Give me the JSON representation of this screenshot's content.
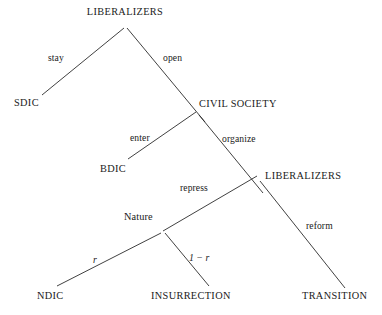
{
  "figure": {
    "type": "game-tree",
    "background_color": "#ffffff",
    "line_color": "#2b2b2b",
    "text_color": "#1a1a1a"
  },
  "nodes": [
    {
      "id": "root",
      "label": "LIBERALIZERS",
      "kind": "player",
      "x": 125,
      "y": 15,
      "anchor": "middle"
    },
    {
      "id": "sdic",
      "label": "SDIC",
      "kind": "outcome",
      "x": 14,
      "y": 106,
      "anchor": "start"
    },
    {
      "id": "civil_society",
      "label": "CIVIL SOCIETY",
      "kind": "player",
      "x": 199,
      "y": 107,
      "anchor": "start"
    },
    {
      "id": "bdic",
      "label": "BDIC",
      "kind": "outcome",
      "x": 100,
      "y": 172,
      "anchor": "start"
    },
    {
      "id": "liberalizers2",
      "label": "LIBERALIZERS",
      "kind": "player",
      "x": 265,
      "y": 179,
      "anchor": "start"
    },
    {
      "id": "nature",
      "label": "Nature",
      "kind": "nature",
      "x": 124,
      "y": 220,
      "anchor": "start"
    },
    {
      "id": "ndic",
      "label": "NDIC",
      "kind": "outcome",
      "x": 37,
      "y": 299,
      "anchor": "start"
    },
    {
      "id": "insurrection",
      "label": "INSURRECTION",
      "kind": "outcome",
      "x": 151,
      "y": 299,
      "anchor": "start"
    },
    {
      "id": "transition",
      "label": "TRANSITION",
      "kind": "outcome",
      "x": 302,
      "y": 299,
      "anchor": "start"
    }
  ],
  "edges": [
    {
      "id": "stay",
      "from": "root",
      "to": "sdic",
      "x1": 124,
      "y1": 28,
      "x2": 42,
      "y2": 95
    },
    {
      "id": "open",
      "from": "root",
      "to": "civil_society",
      "x1": 127,
      "y1": 28,
      "x2": 205,
      "y2": 122
    },
    {
      "id": "enter",
      "from": "civil_society",
      "to": "bdic",
      "x1": 196,
      "y1": 112,
      "x2": 128,
      "y2": 159
    },
    {
      "id": "organize",
      "from": "civil_society",
      "to": "liberalizers2",
      "x1": 199,
      "y1": 115,
      "x2": 263,
      "y2": 193
    },
    {
      "id": "repress",
      "from": "liberalizers2",
      "to": "nature",
      "x1": 257,
      "y1": 176,
      "x2": 163,
      "y2": 231
    },
    {
      "id": "reform",
      "from": "liberalizers2",
      "to": "transition",
      "x1": 260,
      "y1": 181,
      "x2": 345,
      "y2": 288
    },
    {
      "id": "r",
      "from": "nature",
      "to": "ndic",
      "x1": 161,
      "y1": 233,
      "x2": 57,
      "y2": 286
    },
    {
      "id": "one_minus_r",
      "from": "nature",
      "to": "insurrection",
      "x1": 165,
      "y1": 233,
      "x2": 209,
      "y2": 286
    }
  ],
  "edge_labels": [
    {
      "id": "stay",
      "text": "stay",
      "x": 48,
      "y": 61,
      "style": "plain"
    },
    {
      "id": "open",
      "text": "open",
      "x": 163,
      "y": 61,
      "style": "plain"
    },
    {
      "id": "enter",
      "text": "enter",
      "x": 130,
      "y": 141,
      "style": "plain"
    },
    {
      "id": "organize",
      "text": "organize",
      "x": 222,
      "y": 142,
      "style": "plain"
    },
    {
      "id": "repress",
      "text": "repress",
      "x": 180,
      "y": 191,
      "style": "plain"
    },
    {
      "id": "reform",
      "text": "reform",
      "x": 306,
      "y": 229,
      "style": "plain"
    },
    {
      "id": "r",
      "text": "r",
      "x": 93,
      "y": 263,
      "style": "italic"
    },
    {
      "id": "one_minus_r",
      "text": "1 − r",
      "x": 189,
      "y": 261,
      "style": "italic"
    }
  ],
  "prob_parts": {
    "one_value": "1",
    "minus_sign": "−",
    "r_symbol": "r"
  }
}
